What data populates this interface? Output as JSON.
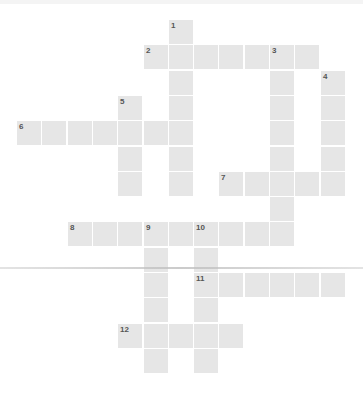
{
  "puzzle": {
    "type": "crossword",
    "cell_color": "#e6e6e6",
    "number_color": "#555555",
    "origin": {
      "x": 17,
      "y": 20
    },
    "pitch": 25.3,
    "words": [
      {
        "number": "1",
        "direction": "down",
        "row": 0,
        "col": 6,
        "length": 7
      },
      {
        "number": "2",
        "direction": "across",
        "row": 1,
        "col": 5,
        "length": 7
      },
      {
        "number": "3",
        "direction": "down",
        "row": 1,
        "col": 10,
        "length": 8
      },
      {
        "number": "4",
        "direction": "down",
        "row": 2,
        "col": 12,
        "length": 5
      },
      {
        "number": "5",
        "direction": "down",
        "row": 3,
        "col": 4,
        "length": 4
      },
      {
        "number": "6",
        "direction": "across",
        "row": 4,
        "col": 0,
        "length": 7
      },
      {
        "number": "7",
        "direction": "across",
        "row": 6,
        "col": 8,
        "length": 5
      },
      {
        "number": "8",
        "direction": "across",
        "row": 8,
        "col": 2,
        "length": 9
      },
      {
        "number": "9",
        "direction": "down",
        "row": 8,
        "col": 5,
        "length": 6
      },
      {
        "number": "10",
        "direction": "down",
        "row": 8,
        "col": 7,
        "length": 6
      },
      {
        "number": "11",
        "direction": "across",
        "row": 10,
        "col": 7,
        "length": 6
      },
      {
        "number": "12",
        "direction": "across",
        "row": 12,
        "col": 4,
        "length": 5
      }
    ]
  }
}
